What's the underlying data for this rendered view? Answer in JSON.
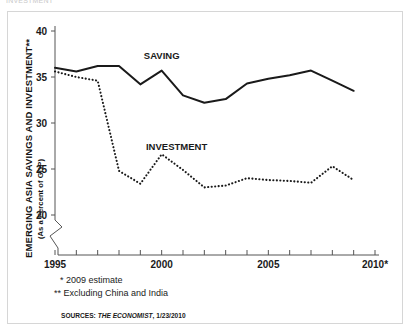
{
  "page": {
    "clipped_top_text": "INVESTMENT"
  },
  "axis_title": {
    "main": "EMERGING ASIA SAVINGS AND INVESTMENT**",
    "sub": "(As a Percent of GDP)"
  },
  "notes": {
    "note_1": "* 2009 estimate",
    "note_2": "** Excluding China and India",
    "sources_prefix": "SOURCES: ",
    "sources_italic": "THE ECONOMIST",
    "sources_suffix": ", 1/23/2010"
  },
  "series_labels": {
    "saving": "SAVING",
    "investment": "INVESTMENT"
  },
  "colors": {
    "line": "#1a1a1a",
    "axis": "#555555",
    "frame": "#d6d6d6",
    "background": "#ffffff"
  },
  "chart_data": {
    "type": "line",
    "title": "",
    "xlabel": "",
    "ylabel": "EMERGING ASIA SAVINGS AND INVESTMENT** (As a Percent of GDP)",
    "xlim": [
      1995,
      2010
    ],
    "ylim": [
      20,
      40
    ],
    "yticks": [
      20,
      25,
      30,
      35,
      40
    ],
    "ytick_labels": [
      "20",
      "25",
      "30",
      "35",
      "40"
    ],
    "xticks": [
      1995,
      1996,
      1997,
      1998,
      1999,
      2000,
      2001,
      2002,
      2003,
      2004,
      2005,
      2006,
      2007,
      2008,
      2009,
      2010
    ],
    "xtick_labels": [
      "1995",
      "",
      "",
      "",
      "",
      "2000",
      "",
      "",
      "",
      "",
      "2005",
      "",
      "",
      "",
      "",
      "2010*"
    ],
    "grid": false,
    "legend": "inline-annotations",
    "y_axis_break": true,
    "x": [
      1995,
      1996,
      1997,
      1998,
      1999,
      2000,
      2001,
      2002,
      2003,
      2004,
      2005,
      2006,
      2007,
      2008,
      2009
    ],
    "series": [
      {
        "name": "SAVING",
        "style": "solid",
        "values": [
          36.0,
          35.6,
          36.2,
          36.2,
          34.2,
          35.7,
          33.0,
          32.2,
          32.6,
          34.3,
          34.8,
          35.2,
          35.7,
          34.6,
          33.5
        ]
      },
      {
        "name": "INVESTMENT",
        "style": "dotted",
        "values": [
          35.6,
          35.0,
          34.6,
          24.8,
          23.4,
          26.6,
          24.9,
          23.0,
          23.2,
          24.0,
          23.8,
          23.7,
          23.5,
          25.3,
          23.8
        ]
      }
    ],
    "annotations": [
      {
        "text": "SAVING",
        "x": 2000.0,
        "y": 37.0
      },
      {
        "text": "INVESTMENT",
        "x": 2000.7,
        "y": 27.1
      }
    ]
  }
}
